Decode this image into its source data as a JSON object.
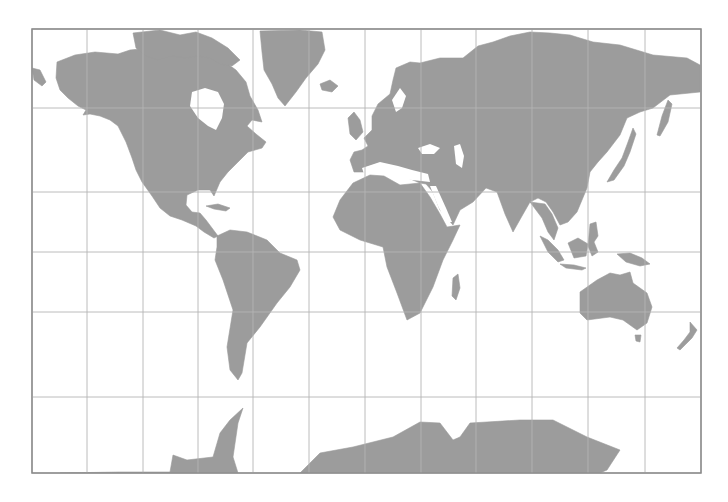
{
  "map": {
    "projection": "Mercator",
    "title": "World Map",
    "colors": {
      "land": "#9c9c9c",
      "water": "#ffffff",
      "grid": "#b4b4b4",
      "frame": "#8c8c8c"
    },
    "frame": {
      "x": 32,
      "y": 29,
      "width": 669,
      "height": 444
    },
    "graticule": {
      "meridians_x": [
        87,
        143,
        198,
        253,
        309,
        365,
        421,
        476,
        532,
        588,
        645
      ],
      "parallels_y": [
        108,
        192,
        252,
        312,
        397
      ],
      "parallel_labels": [
        "60°N",
        "30°N",
        "0°",
        "30°S",
        "60°S"
      ],
      "meridian_step_deg": 30
    },
    "landmasses": [
      {
        "name": "north-america",
        "d": "M57,62 L75,55 L95,52 L118,54 L130,50 L150,48 L170,46 L190,50 L210,52 L222,60 L236,70 L246,82 L250,96 L258,110 L262,122 L252,120 L247,126 L256,134 L266,142 L262,148 L248,152 L238,162 L228,172 L220,182 L214,196 L210,190 L198,190 L187,195 L186,205 L192,212 L200,213 L206,220 L212,228 L218,236 L214,238 L204,232 L196,226 L182,220 L170,216 L160,208 L152,196 L142,182 L136,170 L132,158 L126,142 L118,126 L110,120 L100,116 L90,114 L83,115 L86,110 L78,106 L68,98 L60,90 L56,78 Z"
      },
      {
        "name": "hudson-bay",
        "water": true,
        "d": "M192,92 L205,88 L218,92 L224,104 L222,118 L216,130 L208,126 L198,118 L190,106 Z"
      },
      {
        "name": "canadian-arctic-islands",
        "d": "M133,33 L160,30 L180,35 L196,32 L212,38 L228,48 L240,60 L232,66 L220,64 L210,58 L198,56 L186,58 L172,56 L158,60 L146,56 L136,48 Z"
      },
      {
        "name": "greenland",
        "d": "M260,31 L300,30 L322,32 L325,50 L318,64 L306,78 L296,92 L285,106 L278,98 L272,84 L264,70 L262,52 Z"
      },
      {
        "name": "iceland",
        "d": "M320,84 L330,80 L338,86 L332,92 L322,90 Z"
      },
      {
        "name": "cuba-caribbean",
        "d": "M206,206 L218,204 L230,208 L226,211 L214,209 Z"
      },
      {
        "name": "south-america",
        "d": "M217,236 L230,230 L247,232 L267,240 L280,253 L297,260 L300,270 L290,287 L277,303 L260,327 L247,343 L242,373 L238,380 L230,370 L227,347 L233,310 L223,280 L215,260 L217,247 Z"
      },
      {
        "name": "europe-asia",
        "d": "M350,160 L354,152 L362,150 L368,146 L364,138 L372,130 L372,116 L378,104 L390,94 L393,80 L396,68 L410,62 L420,63 L440,58 L463,58 L478,46 L493,42 L510,36 L530,32 L550,33 L570,35 L593,42 L620,45 L653,55 L687,58 L700,65 L700,92 L670,95 L653,108 L640,112 L627,118 L620,135 L607,152 L598,162 L590,172 L587,188 L577,212 L568,222 L560,225 L553,212 L546,202 L538,198 L530,202 L522,216 L513,232 L505,214 L497,192 L486,188 L473,202 L460,210 L453,225 L440,210 L433,192 L426,184 L420,183 L408,178 L400,170 L390,166 L380,170 L370,172 L362,172 L354,172 Z"
      },
      {
        "name": "uk",
        "d": "M348,118 L354,112 L360,120 L363,132 L356,140 L350,134 Z"
      },
      {
        "name": "scandinavia-gap",
        "water": true,
        "d": "M392,100 L400,88 L406,96 L402,108 L396,112 Z"
      },
      {
        "name": "black-sea",
        "water": true,
        "d": "M418,148 L430,144 L440,148 L434,154 L422,154 Z"
      },
      {
        "name": "caspian",
        "water": true,
        "d": "M454,146 L460,144 L464,156 L462,168 L456,164 Z"
      },
      {
        "name": "mediterranean",
        "water": true,
        "d": "M362,168 L380,162 L398,166 L412,170 L428,174 L430,182 L412,180 L394,178 L376,176 L364,174 Z"
      },
      {
        "name": "africa",
        "d": "M340,200 L353,183 L370,175 L384,176 L400,185 L420,183 L430,197 L440,214 L447,227 L460,225 L453,240 L443,260 L433,287 L420,313 L407,320 L397,293 L387,267 L383,247 L360,240 L340,230 L333,217 Z"
      },
      {
        "name": "red-sea",
        "water": true,
        "d": "M430,186 L436,186 L446,208 L452,222 L446,222 L438,206 Z"
      },
      {
        "name": "madagascar",
        "d": "M453,278 L458,274 L460,288 L456,300 L452,296 Z"
      },
      {
        "name": "japan",
        "d": "M607,182 L614,170 L622,158 L628,142 L633,128 L636,134 L630,152 L624,166 L614,180 Z"
      },
      {
        "name": "kamchatka-sakhalin",
        "d": "M657,135 L662,116 L668,100 L672,104 L668,122 L660,136 Z"
      },
      {
        "name": "sri-lanka-indochina",
        "d": "M530,202 L545,204 L552,214 L558,228 L554,240 L548,232 L542,218 L536,210 Z"
      },
      {
        "name": "sumatra",
        "d": "M540,236 L548,240 L558,250 L564,260 L558,262 L548,252 Z"
      },
      {
        "name": "java",
        "d": "M560,264 L574,265 L586,268 L582,270 L566,268 Z"
      },
      {
        "name": "borneo",
        "d": "M568,243 L578,238 L588,244 L586,256 L574,258 Z"
      },
      {
        "name": "sulawesi-philippines",
        "d": "M590,224 L596,222 L598,236 L594,242 L598,252 L592,256 L588,246 Z"
      },
      {
        "name": "new-guinea",
        "d": "M617,254 L630,253 L642,258 L650,264 L640,266 L626,262 Z"
      },
      {
        "name": "australia",
        "d": "M580,292 L597,280 L610,273 L620,275 L630,272 L633,283 L647,293 L652,307 L647,323 L637,330 L623,320 L610,317 L587,320 L580,313 Z"
      },
      {
        "name": "tasmania",
        "d": "M635,335 L641,335 L640,342 L636,341 Z"
      },
      {
        "name": "new-zealand",
        "d": "M690,322 L697,330 L692,338 L686,344 L680,350 L677,348 L684,340 L690,332 Z"
      },
      {
        "name": "alaska-aleutians",
        "d": "M32,68 L40,70 L46,82 L42,86 L34,80 Z"
      },
      {
        "name": "antarctica-peninsula",
        "d": "M60,473 L120,472 L150,472 L170,472 L173,455 L187,460 L213,457 L220,433 L230,420 L243,408 L238,423 L233,457 L238,473 Z"
      },
      {
        "name": "antarctica-main",
        "d": "M300,473 L320,453 L353,447 L393,437 L420,422 L440,423 L453,440 L460,437 L470,423 L487,422 L520,420 L553,420 L587,437 L620,450 L607,470 L600,473 Z"
      }
    ]
  }
}
